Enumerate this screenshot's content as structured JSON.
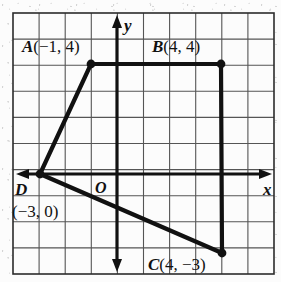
{
  "figure": {
    "type": "coordinate-plane-quadrilateral",
    "axis_labels": {
      "x": "x",
      "y": "y",
      "origin": "O"
    },
    "grid": {
      "cell_px": 26.1,
      "left_px": 13,
      "top_px": 13,
      "cols": 10,
      "rows": 10,
      "origin_px": {
        "x": 117,
        "y": 174
      },
      "line_color": "#555555",
      "border_color": "#2b2b2b",
      "background": "#fcfcfc"
    },
    "stroke_color": "#111111",
    "points": [
      {
        "id": "A",
        "label_name": "A",
        "coords_text": "(−1, 4)",
        "full_label": "A(−1, 4)",
        "x": -1,
        "y": 4,
        "px": 91,
        "py": 64,
        "label_px": {
          "x": 22,
          "y": 38
        }
      },
      {
        "id": "B",
        "label_name": "B",
        "coords_text": "(4, 4)",
        "full_label": "B(4, 4)",
        "x": 4,
        "y": 4,
        "px": 221,
        "py": 64,
        "label_px": {
          "x": 152,
          "y": 38
        }
      },
      {
        "id": "C",
        "label_name": "C",
        "coords_text": "(4, −3)",
        "full_label": "C(4, −3)",
        "x": 4,
        "y": -3,
        "px": 222,
        "py": 253,
        "label_px": {
          "x": 148,
          "y": 256
        }
      },
      {
        "id": "D",
        "label_name": "D",
        "coords_text": "(−3, 0)",
        "full_label": "D (−3, 0)",
        "x": -3,
        "y": 0,
        "px": 40,
        "py": 174,
        "label_px": {
          "x": 15,
          "y": 181
        },
        "coords_label_px": {
          "x": 12,
          "y": 203
        }
      }
    ],
    "edges": [
      {
        "from": "A",
        "to": "B"
      },
      {
        "from": "B",
        "to": "C"
      },
      {
        "from": "C",
        "to": "D"
      },
      {
        "from": "D",
        "to": "A"
      }
    ]
  }
}
